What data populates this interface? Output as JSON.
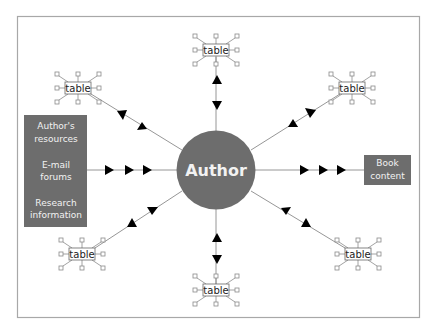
{
  "center": {
    "label": "Author",
    "fill": "#6d6d6d"
  },
  "sources_box": {
    "fill": "#6d6d6d",
    "items": [
      {
        "line1": "Author's",
        "line2": "resources"
      },
      {
        "line1": "E-mail",
        "line2": "forums"
      },
      {
        "line1": "Research",
        "line2": "information"
      }
    ]
  },
  "output_box": {
    "line1": "Book",
    "line2": "content",
    "fill": "#6d6d6d"
  },
  "tables": [
    {
      "id": "top",
      "label": "table"
    },
    {
      "id": "top-left",
      "label": "table"
    },
    {
      "id": "top-right",
      "label": "table"
    },
    {
      "id": "bottom-left",
      "label": "table"
    },
    {
      "id": "bottom",
      "label": "table"
    },
    {
      "id": "bottom-right",
      "label": "table"
    }
  ],
  "colors": {
    "frame": "#a8a8a8",
    "line": "#8a8a8a",
    "arrow": "#000000",
    "box": "#6d6d6d"
  }
}
